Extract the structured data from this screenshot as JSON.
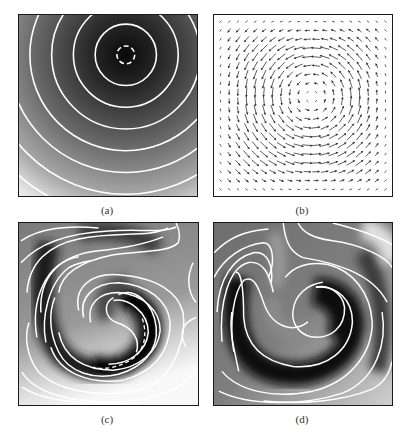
{
  "figure": {
    "panels": [
      {
        "id": "a",
        "label": "(a)",
        "kind": "contour",
        "description": "Concentric circular isolines around a dark minimum near upper center; dashed innermost contour"
      },
      {
        "id": "b",
        "label": "(b)",
        "kind": "quiver",
        "description": "Counter-clockwise rotating vortex velocity field"
      },
      {
        "id": "c",
        "label": "(c)",
        "kind": "contour",
        "description": "Field wound into a two-armed spiral by the vortex; dashed contours in dark band"
      },
      {
        "id": "d",
        "label": "(d)",
        "kind": "contour",
        "description": "Further wound spiral with dark S-shaped bands"
      }
    ]
  },
  "chart_data": [
    {
      "type": "heatmap",
      "panel": "(a)",
      "title": "",
      "xlabel": "",
      "ylabel": "",
      "colormap": "grayscale (dark = low, light = high)",
      "contours": {
        "color": "#ffffff",
        "count": 9,
        "shape": "concentric circles",
        "center": [
          0.6,
          0.22
        ],
        "innermost_dashed": true
      },
      "grid": false,
      "legend": "none"
    },
    {
      "type": "quiver",
      "panel": "(b)",
      "title": "",
      "grid_size": [
        20,
        20
      ],
      "vortex_center": [
        0.55,
        0.45
      ],
      "rotation": "counter-clockwise",
      "arrow_color": "#333333",
      "legend": "none"
    },
    {
      "type": "heatmap",
      "panel": "(c)",
      "title": "",
      "colormap": "grayscale",
      "contours": {
        "color": "#ffffff",
        "count": 11,
        "shape": "two-armed spiral",
        "dashed_segments": true
      },
      "legend": "none"
    },
    {
      "type": "heatmap",
      "panel": "(d)",
      "title": "",
      "colormap": "grayscale",
      "contours": {
        "color": "#ffffff",
        "count": 12,
        "shape": "wound S-spiral"
      },
      "legend": "none"
    }
  ],
  "labels": {
    "a": "(a)",
    "b": "(b)",
    "c": "(c)",
    "d": "(d)"
  }
}
